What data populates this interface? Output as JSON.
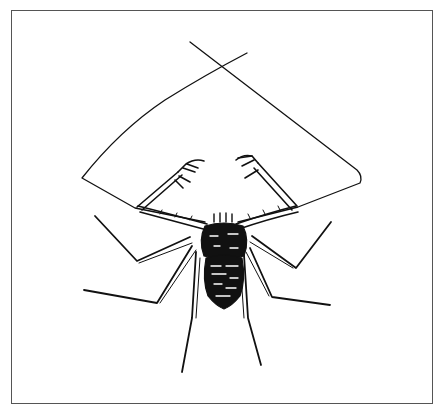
{
  "figure": {
    "style": "black ink line drawing on white",
    "colors": {
      "ink": "#111111",
      "frame": "#555555",
      "background": "#ffffff"
    },
    "parts": [
      "antennae (whip legs)",
      "pedipalps with spined claws",
      "carapace",
      "abdomen",
      "walking legs"
    ]
  }
}
